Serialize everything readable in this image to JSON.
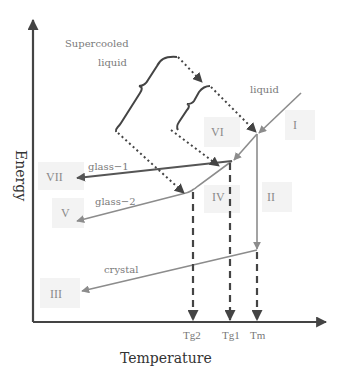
{
  "axes": {
    "x_title": "Temperature",
    "y_title": "Energy"
  },
  "annotations": {
    "supercooled_line1": "Supercooled",
    "supercooled_line2": "liquid",
    "liquid": "liquid",
    "glass1": "glass−1",
    "glass2": "glass−2",
    "crystal": "crystal"
  },
  "regions": {
    "I": "I",
    "II": "II",
    "III": "III",
    "IV": "IV",
    "V": "V",
    "VI": "VI",
    "VII": "VII"
  },
  "temperature_marks": {
    "tg2": "Tg2",
    "tg1": "Tg1",
    "tm": "Tm"
  },
  "colors": {
    "axis": "#444444",
    "dark_line": "#555555",
    "light_line": "#8c8c8c",
    "label_box": "#f3f3f3"
  }
}
